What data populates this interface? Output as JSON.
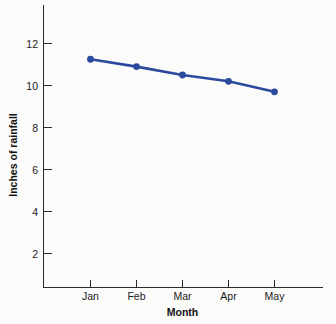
{
  "chart_data": {
    "type": "line",
    "title": "",
    "xlabel": "Month",
    "ylabel": "Inches of rainfall",
    "categories": [
      "Jan",
      "Feb",
      "Mar",
      "Apr",
      "May"
    ],
    "values": [
      11.25,
      10.9,
      10.5,
      10.2,
      9.7
    ],
    "series": [
      {
        "name": "Inches of rainfall",
        "values": [
          11.25,
          10.9,
          10.5,
          10.2,
          9.7
        ],
        "color": "#2b4a9e"
      }
    ],
    "ylim": [
      0,
      13
    ],
    "yticks": [
      2,
      4,
      6,
      8,
      10,
      12
    ],
    "ytick_labels": [
      "2",
      "4",
      "6",
      "8",
      "10",
      "12"
    ],
    "xtick_labels": [
      "Jan",
      "Feb",
      "Mar",
      "Apr",
      "May"
    ],
    "grid": false,
    "legend": false,
    "legend_position": "none",
    "marker": "circle",
    "axis_color": "#2b2b2b",
    "background": "#fbfbfa"
  },
  "axes": {
    "x_title": "Month",
    "y_title": "Inches of rainfall"
  }
}
